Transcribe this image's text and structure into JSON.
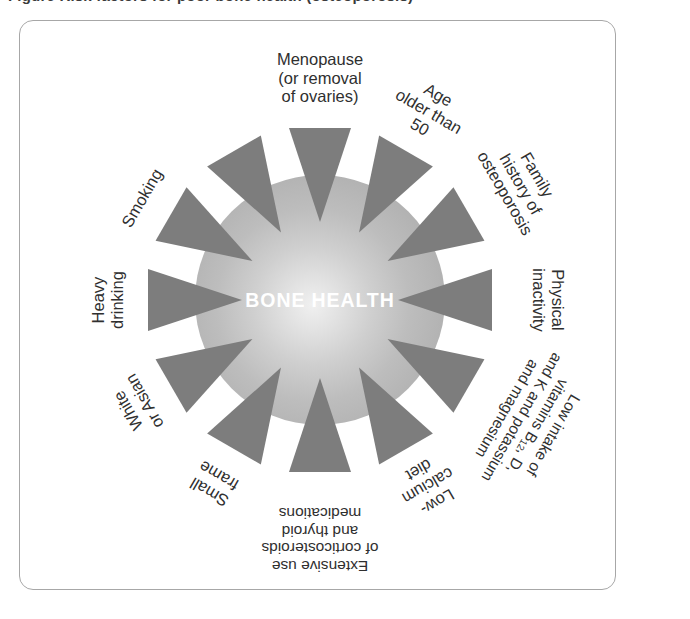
{
  "caption": {
    "text": "Figure  Risk factors for poor bone health (osteoporosis)"
  },
  "diagram": {
    "center_label": "BONE HEALTH",
    "arrow_count": 12,
    "colors": {
      "arrow": "#7d7d7d",
      "disc_outer": "#ababab",
      "disc_inner": "#f0f0f0",
      "label_text": "#2f2f2f",
      "center_text": "#ffffff",
      "frame_border": "#a7a7a7",
      "background": "#ffffff"
    },
    "factors": [
      {
        "id": "menopause",
        "lines": [
          "Menopause",
          "(or removal",
          "of ovaries)"
        ],
        "angle_deg": 0
      },
      {
        "id": "age-older-than-50",
        "lines": [
          "Age",
          "older than",
          "50"
        ],
        "angle_deg": 30
      },
      {
        "id": "family-history-of-osteoporosis",
        "lines": [
          "Family",
          "history of",
          "osteoporosis"
        ],
        "angle_deg": 60
      },
      {
        "id": "physical-inactivity",
        "lines": [
          "Physical",
          "inactivity"
        ],
        "angle_deg": 90
      },
      {
        "id": "low-intake-of-vitamins",
        "lines": [
          "Low intake of",
          "vitamins B12, D,",
          "and K and potassium",
          "and magnesium"
        ],
        "angle_deg": 120
      },
      {
        "id": "low-calcium-diet",
        "lines": [
          "Low-",
          "calcium",
          "diet"
        ],
        "angle_deg": 150
      },
      {
        "id": "extensive-use-of-corticosteroids",
        "lines": [
          "Extensive use",
          "of corticosteroids",
          "and thyroid",
          "medications"
        ],
        "angle_deg": 180
      },
      {
        "id": "small-frame",
        "lines": [
          "Small",
          "frame"
        ],
        "angle_deg": 210
      },
      {
        "id": "white-or-asian",
        "lines": [
          "White",
          "or Asian"
        ],
        "angle_deg": 240
      },
      {
        "id": "heavy-drinking",
        "lines": [
          "Heavy",
          "drinking"
        ],
        "angle_deg": 270
      },
      {
        "id": "smoking",
        "lines": [
          "Smoking"
        ],
        "angle_deg": 300
      }
    ]
  }
}
